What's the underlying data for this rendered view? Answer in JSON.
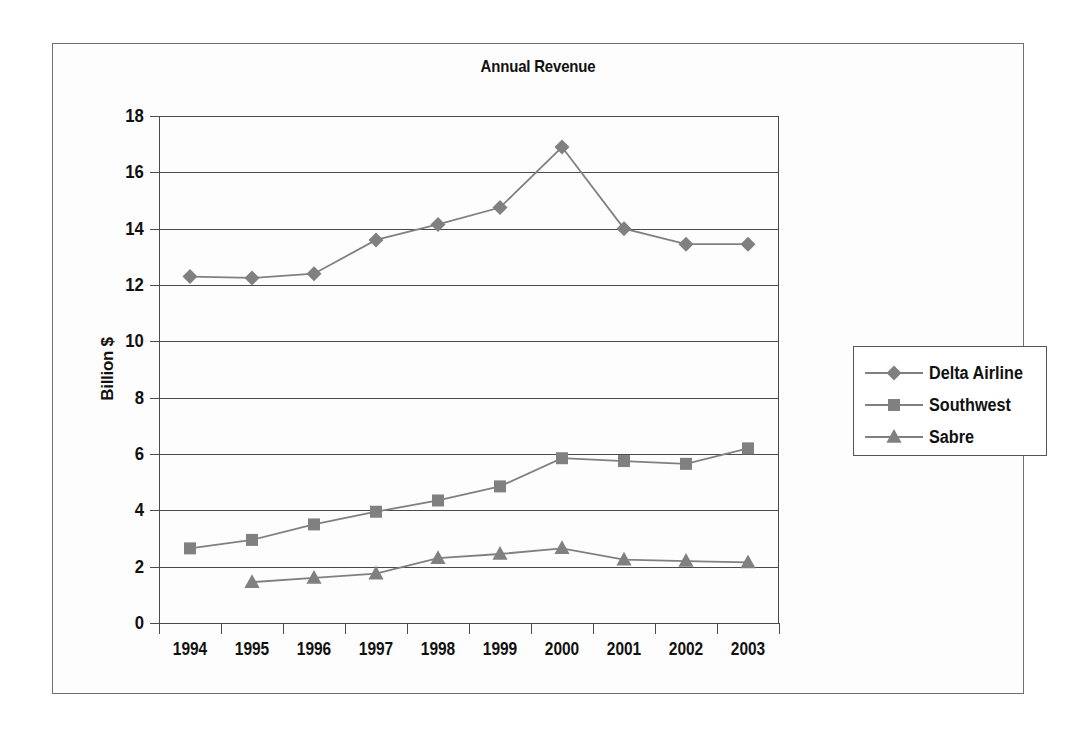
{
  "chart_data": {
    "type": "line",
    "title": "Annual Revenue",
    "xlabel": "",
    "ylabel": "Billion $",
    "categories": [
      "1994",
      "1995",
      "1996",
      "1997",
      "1998",
      "1999",
      "2000",
      "2001",
      "2002",
      "2003"
    ],
    "ylim": [
      0,
      18
    ],
    "ytick_labels": [
      "0",
      "2",
      "4",
      "6",
      "8",
      "10",
      "12",
      "14",
      "16",
      "18"
    ],
    "ytick_values": [
      0,
      2,
      4,
      6,
      8,
      10,
      12,
      14,
      16,
      18
    ],
    "grid": true,
    "legend_position": "right",
    "series": [
      {
        "name": "Delta Airline",
        "marker": "diamond",
        "color": "#808080",
        "values": [
          12.3,
          12.25,
          12.4,
          13.6,
          14.15,
          14.75,
          16.9,
          14.0,
          13.45,
          13.45
        ]
      },
      {
        "name": "Southwest",
        "marker": "square",
        "color": "#808080",
        "values": [
          2.65,
          2.95,
          3.5,
          3.95,
          4.35,
          4.85,
          5.85,
          5.75,
          5.65,
          6.2
        ]
      },
      {
        "name": "Sabre",
        "marker": "triangle",
        "color": "#808080",
        "values": [
          null,
          1.45,
          1.6,
          1.75,
          2.3,
          2.45,
          2.65,
          2.25,
          2.2,
          2.15
        ]
      }
    ]
  },
  "legend": {
    "entries": [
      {
        "label": "Delta Airline"
      },
      {
        "label": "Southwest"
      },
      {
        "label": "Sabre"
      }
    ]
  }
}
